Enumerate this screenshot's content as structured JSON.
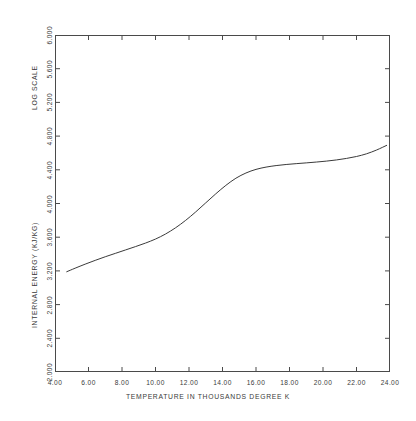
{
  "chart_data": {
    "type": "line",
    "title": "",
    "xlabel": "TEMPERATURE IN THOUSANDS DEGREE K",
    "ylabel": "INTERNAL ENERGY (KJ/KG)",
    "ylabel_secondary": "LOG SCALE",
    "xlim": [
      4.0,
      24.0
    ],
    "ylim": [
      2.0,
      6.0
    ],
    "grid": false,
    "legend": null,
    "xticks": [
      "4.00",
      "6.00",
      "8.00",
      "10.00",
      "12.00",
      "14.00",
      "16.00",
      "18.00",
      "20.00",
      "22.00",
      "24.00"
    ],
    "xtick_values": [
      4,
      6,
      8,
      10,
      12,
      14,
      16,
      18,
      20,
      22,
      24
    ],
    "yticks": [
      "2.000",
      "2.400",
      "2.800",
      "3.200",
      "3.600",
      "4.000",
      "4.400",
      "4.800",
      "5.200",
      "5.600",
      "6.000"
    ],
    "ytick_values": [
      2.0,
      2.4,
      2.8,
      3.2,
      3.6,
      4.0,
      4.4,
      4.8,
      5.2,
      5.6,
      6.0
    ],
    "series": [
      {
        "name": "internal energy",
        "color": "#3a3a3a",
        "x": [
          4.7,
          5.2,
          5.8,
          6.4,
          7.0,
          7.6,
          8.2,
          8.8,
          9.4,
          10.0,
          10.6,
          11.2,
          11.8,
          12.4,
          13.0,
          13.6,
          14.2,
          14.8,
          15.4,
          16.0,
          16.6,
          17.2,
          17.8,
          18.4,
          19.0,
          19.6,
          20.2,
          20.8,
          21.4,
          22.0,
          22.6,
          23.2,
          23.8
        ],
        "y": [
          3.19,
          3.232,
          3.28,
          3.325,
          3.368,
          3.408,
          3.448,
          3.488,
          3.53,
          3.578,
          3.638,
          3.712,
          3.8,
          3.9,
          4.008,
          4.115,
          4.215,
          4.3,
          4.362,
          4.405,
          4.432,
          4.45,
          4.463,
          4.473,
          4.482,
          4.492,
          4.503,
          4.517,
          4.535,
          4.558,
          4.59,
          4.635,
          4.69
        ]
      }
    ]
  },
  "axes": {
    "x_title": "TEMPERATURE IN THOUSANDS DEGREE K",
    "y_title_energy": "INTERNAL ENERGY (KJ/KG)",
    "y_title_scale": "LOG SCALE"
  },
  "caption": {
    "text": ""
  }
}
